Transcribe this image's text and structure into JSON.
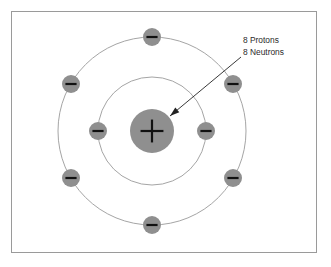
{
  "figure": {
    "frame": {
      "border_color": "#9a9a9a",
      "background_color": "#ffffff",
      "x": 11,
      "y": 11,
      "width": 306,
      "height": 242
    },
    "center": {
      "x": 152,
      "y": 131
    }
  },
  "nucleus": {
    "name": "nucleus",
    "symbol": "+",
    "radius": 22,
    "fill_color": "#8f8f8f",
    "sign_color": "#111111"
  },
  "orbits": [
    {
      "name": "inner-shell",
      "radius": 54,
      "stroke_color": "#a5a5a5",
      "electron_count": 2
    },
    {
      "name": "outer-shell",
      "radius": 94,
      "stroke_color": "#a5a5a5",
      "electron_count": 6
    }
  ],
  "electrons": [
    {
      "name": "electron-inner-left",
      "shell": "inner-shell",
      "symbol": "−",
      "angle_deg": 180,
      "cx": 98,
      "cy": 131
    },
    {
      "name": "electron-inner-right",
      "shell": "inner-shell",
      "symbol": "−",
      "angle_deg": 0,
      "cx": 206,
      "cy": 131
    },
    {
      "name": "electron-outer-top",
      "shell": "outer-shell",
      "symbol": "−",
      "angle_deg": 90,
      "cx": 152,
      "cy": 37
    },
    {
      "name": "electron-outer-upper-right",
      "shell": "outer-shell",
      "symbol": "−",
      "angle_deg": 30,
      "cx": 233,
      "cy": 84
    },
    {
      "name": "electron-outer-lower-right",
      "shell": "outer-shell",
      "symbol": "−",
      "angle_deg": 330,
      "cx": 233,
      "cy": 178
    },
    {
      "name": "electron-outer-bottom",
      "shell": "outer-shell",
      "symbol": "−",
      "angle_deg": 270,
      "cx": 152,
      "cy": 225
    },
    {
      "name": "electron-outer-lower-left",
      "shell": "outer-shell",
      "symbol": "−",
      "angle_deg": 210,
      "cx": 71,
      "cy": 178
    },
    {
      "name": "electron-outer-upper-left",
      "shell": "outer-shell",
      "symbol": "−",
      "angle_deg": 150,
      "cx": 71,
      "cy": 84
    }
  ],
  "electron_style": {
    "radius": 9,
    "fill_color": "#8f8f8f",
    "sign_color": "#111111"
  },
  "annotation": {
    "name": "nucleus-callout",
    "lines": [
      "8 Protons",
      "8 Neutrons"
    ],
    "protons_label": "8 Protons",
    "neutrons_label": "8 Neutrons",
    "text_color": "#2b2b2b",
    "leader_color": "#222222",
    "text_x": 243,
    "protons_y": 43,
    "neutrons_y": 55,
    "leader_start": {
      "x": 241,
      "y": 57
    },
    "leader_end": {
      "x": 170,
      "y": 116
    }
  }
}
